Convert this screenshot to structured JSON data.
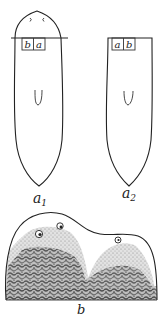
{
  "figure": {
    "panels": [
      {
        "id": "a1",
        "label_main": "a",
        "label_sub": "1",
        "graft_box": [
          "b",
          "a"
        ],
        "has_head": true,
        "has_eyes": true,
        "has_cut_line": true
      },
      {
        "id": "a2",
        "label_main": "a",
        "label_sub": "2",
        "graft_box": [
          "a",
          "b"
        ],
        "has_head": false,
        "has_eyes": false,
        "has_cut_line": false
      },
      {
        "id": "b",
        "label_main": "b",
        "description": "Regenerated double-headed fragment with pigmented mottling"
      }
    ],
    "colors": {
      "line": "#222222",
      "pigment_dark": "#555555",
      "pigment_light": "#aaaaaa",
      "background": "#ffffff"
    }
  }
}
